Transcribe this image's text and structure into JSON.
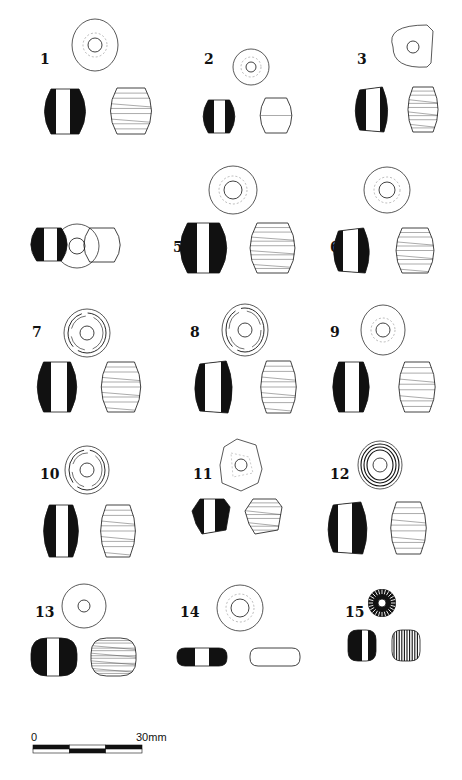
{
  "figure": {
    "type": "archaeological bead illustration plate",
    "background": "#ffffff",
    "ink": "#111111"
  },
  "beads": [
    {
      "id": "1",
      "label": "1",
      "label_pos": [
        40,
        60
      ],
      "top": {
        "cx": 95,
        "cy": 45,
        "rx": 23,
        "ry": 26,
        "hole": 7,
        "shape": "round"
      },
      "section": {
        "x": 40,
        "y": 89,
        "w": 50,
        "h": 45,
        "white": [
          16,
          30
        ],
        "shape": "barrel"
      },
      "profile": {
        "x": 106,
        "y": 88,
        "w": 50,
        "h": 46,
        "stripes": 8
      }
    },
    {
      "id": "2",
      "label": "2",
      "label_pos": [
        204,
        60
      ],
      "top": {
        "cx": 251,
        "cy": 67,
        "rx": 18,
        "ry": 18,
        "hole": 5,
        "shape": "round"
      },
      "section": {
        "x": 200,
        "y": 100,
        "w": 38,
        "h": 33,
        "white": [
          14,
          25
        ],
        "shape": "barrel"
      },
      "profile": {
        "x": 257,
        "y": 98,
        "w": 38,
        "h": 35,
        "stripes": 1
      }
    },
    {
      "id": "3",
      "label": "3",
      "label_pos": [
        357,
        60
      ],
      "top": {
        "cx": 413,
        "cy": 47,
        "rx": 20,
        "ry": 22,
        "hole": 6,
        "shape": "half"
      },
      "section": {
        "x": 352,
        "y": 87,
        "w": 38,
        "h": 45,
        "white": [
          14,
          28
        ],
        "shape": "truncated"
      },
      "profile": {
        "x": 405,
        "y": 87,
        "w": 36,
        "h": 45,
        "stripes": 10
      }
    },
    {
      "id": "4",
      "label": "4",
      "label_pos": [
        32,
        248
      ],
      "top": {
        "cx": 77,
        "cy": 246,
        "rx": 22,
        "ry": 22,
        "hole": 8,
        "shape": "round"
      },
      "section": {
        "x": 27,
        "y": 228,
        "w": 44,
        "h": 33,
        "white": [
          17,
          30
        ],
        "shape": "barrel"
      },
      "profile": {
        "x": 80,
        "y": 228,
        "w": 44,
        "h": 34,
        "stripes": 0
      }
    },
    {
      "id": "5",
      "label": "5",
      "label_pos": [
        173,
        248
      ],
      "top": {
        "cx": 233,
        "cy": 190,
        "rx": 24,
        "ry": 24,
        "hole": 9,
        "shape": "round"
      },
      "section": {
        "x": 175,
        "y": 223,
        "w": 57,
        "h": 50,
        "white": [
          22,
          34
        ],
        "shape": "barrel"
      },
      "profile": {
        "x": 245,
        "y": 223,
        "w": 55,
        "h": 50,
        "stripes": 10
      }
    },
    {
      "id": "6",
      "label": "6",
      "label_pos": [
        330,
        248
      ],
      "top": {
        "cx": 387,
        "cy": 190,
        "rx": 23,
        "ry": 23,
        "hole": 8,
        "shape": "round"
      },
      "section": {
        "x": 330,
        "y": 228,
        "w": 42,
        "h": 45,
        "white": [
          13,
          28
        ],
        "shape": "truncated"
      },
      "profile": {
        "x": 392,
        "y": 228,
        "w": 46,
        "h": 45,
        "stripes": 9
      }
    },
    {
      "id": "7",
      "label": "7",
      "label_pos": [
        32,
        333
      ],
      "top": {
        "cx": 87,
        "cy": 333,
        "rx": 23,
        "ry": 24,
        "hole": 7,
        "shape": "rings"
      },
      "section": {
        "x": 33,
        "y": 362,
        "w": 48,
        "h": 50,
        "white": [
          18,
          34
        ],
        "shape": "barrel"
      },
      "profile": {
        "x": 97,
        "y": 362,
        "w": 48,
        "h": 50,
        "stripes": 9
      }
    },
    {
      "id": "8",
      "label": "8",
      "label_pos": [
        190,
        333
      ],
      "top": {
        "cx": 245,
        "cy": 330,
        "rx": 23,
        "ry": 26,
        "hole": 7,
        "shape": "rings"
      },
      "section": {
        "x": 191,
        "y": 361,
        "w": 44,
        "h": 52,
        "white": [
          14,
          30
        ],
        "shape": "truncated"
      },
      "profile": {
        "x": 257,
        "y": 361,
        "w": 43,
        "h": 52,
        "stripes": 9
      }
    },
    {
      "id": "9",
      "label": "9",
      "label_pos": [
        330,
        333
      ],
      "top": {
        "cx": 383,
        "cy": 330,
        "rx": 22,
        "ry": 25,
        "hole": 7,
        "shape": "round"
      },
      "section": {
        "x": 329,
        "y": 362,
        "w": 44,
        "h": 50,
        "white": [
          16,
          30
        ],
        "shape": "barrel"
      },
      "profile": {
        "x": 395,
        "y": 362,
        "w": 44,
        "h": 50,
        "stripes": 8
      }
    },
    {
      "id": "10",
      "label": "10",
      "label_pos": [
        40,
        475
      ],
      "top": {
        "cx": 87,
        "cy": 470,
        "rx": 22,
        "ry": 24,
        "hole": 7,
        "shape": "rings"
      },
      "section": {
        "x": 40,
        "y": 505,
        "w": 42,
        "h": 52,
        "white": [
          16,
          28
        ],
        "shape": "barrel"
      },
      "profile": {
        "x": 97,
        "y": 505,
        "w": 42,
        "h": 52,
        "stripes": 9
      }
    },
    {
      "id": "11",
      "label": "11",
      "label_pos": [
        193,
        475
      ],
      "top": {
        "cx": 241,
        "cy": 465,
        "rx": 21,
        "ry": 26,
        "hole": 6,
        "shape": "hex"
      },
      "section": {
        "x": 192,
        "y": 499,
        "w": 38,
        "h": 35,
        "white": [
          12,
          23
        ],
        "shape": "facet"
      },
      "profile": {
        "x": 245,
        "y": 499,
        "w": 37,
        "h": 35,
        "stripes": 8
      }
    },
    {
      "id": "12",
      "label": "12",
      "label_pos": [
        330,
        475
      ],
      "top": {
        "cx": 380,
        "cy": 465,
        "rx": 22,
        "ry": 24,
        "hole": 7,
        "shape": "rings3"
      },
      "section": {
        "x": 324,
        "y": 502,
        "w": 46,
        "h": 52,
        "white": [
          14,
          28
        ],
        "shape": "truncated"
      },
      "profile": {
        "x": 387,
        "y": 502,
        "w": 43,
        "h": 52,
        "stripes": 8
      }
    },
    {
      "id": "13",
      "label": "13",
      "label_pos": [
        35,
        613
      ],
      "top": {
        "cx": 84,
        "cy": 606,
        "rx": 22,
        "ry": 22,
        "hole": 6,
        "shape": "round"
      },
      "section": {
        "x": 31,
        "y": 638,
        "w": 46,
        "h": 38,
        "white": [
          16,
          28
        ],
        "shape": "rounded"
      },
      "profile": {
        "x": 91,
        "y": 638,
        "w": 45,
        "h": 38,
        "stripes": 14
      }
    },
    {
      "id": "14",
      "label": "14",
      "label_pos": [
        180,
        613
      ],
      "top": {
        "cx": 240,
        "cy": 608,
        "rx": 23,
        "ry": 23,
        "hole": 9,
        "shape": "round"
      },
      "section": {
        "x": 177,
        "y": 648,
        "w": 50,
        "h": 18,
        "white": [
          18,
          32
        ],
        "shape": "rounded"
      },
      "profile": {
        "x": 250,
        "y": 648,
        "w": 50,
        "h": 18,
        "stripes": 0
      }
    },
    {
      "id": "15",
      "label": "15",
      "label_pos": [
        345,
        613
      ],
      "top": {
        "cx": 382,
        "cy": 603,
        "rx": 14,
        "ry": 14,
        "hole": 4,
        "shape": "ribbed"
      },
      "section": {
        "x": 348,
        "y": 630,
        "w": 28,
        "h": 31,
        "white": [
          14,
          20
        ],
        "shape": "rounded"
      },
      "profile": {
        "x": 392,
        "y": 630,
        "w": 28,
        "h": 31,
        "stripes": -1
      }
    }
  ],
  "scale_bar": {
    "start_label": "0",
    "end_label": "30mm",
    "x": 33,
    "y": 745,
    "width": 109,
    "height": 8,
    "segments": 3
  }
}
